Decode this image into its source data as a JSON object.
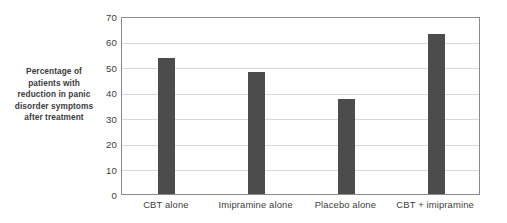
{
  "chart_data": {
    "type": "bar",
    "title": "",
    "subtitle": "",
    "xlabel": "",
    "ylabel": "Percentage of patients with reduction in panic disorder symptoms after treatment",
    "categories": [
      "CBT alone",
      "Imipramine alone",
      "Placebo alone",
      "CBT + imipramine"
    ],
    "values": [
      53.5,
      48,
      37.5,
      63
    ],
    "ylim": [
      0,
      70
    ],
    "ytick_values": [
      0,
      10,
      20,
      30,
      40,
      50,
      60,
      70
    ],
    "ytick_labels": [
      "0",
      "10",
      "20",
      "30",
      "40",
      "50",
      "60",
      "70"
    ],
    "grid": "horizontal",
    "legend": "none",
    "series": [
      {
        "name": "Percentage of patients with reduction in panic disorder symptoms",
        "values": [
          53.5,
          48,
          37.5,
          63
        ]
      }
    ],
    "annotations": []
  },
  "axis": {
    "y_title_lines": [
      "Percentage of",
      "patients with",
      "reduction in panic",
      "disorder symptoms",
      "after treatment"
    ]
  },
  "colors": {
    "bar_fill": "#4c4c4c",
    "gridline": "#d9d9d9",
    "axis_frame": "#8a8a8a",
    "tick_text": "#3d3d3d",
    "title_text": "#3b3b3b",
    "background": "#ffffff"
  }
}
